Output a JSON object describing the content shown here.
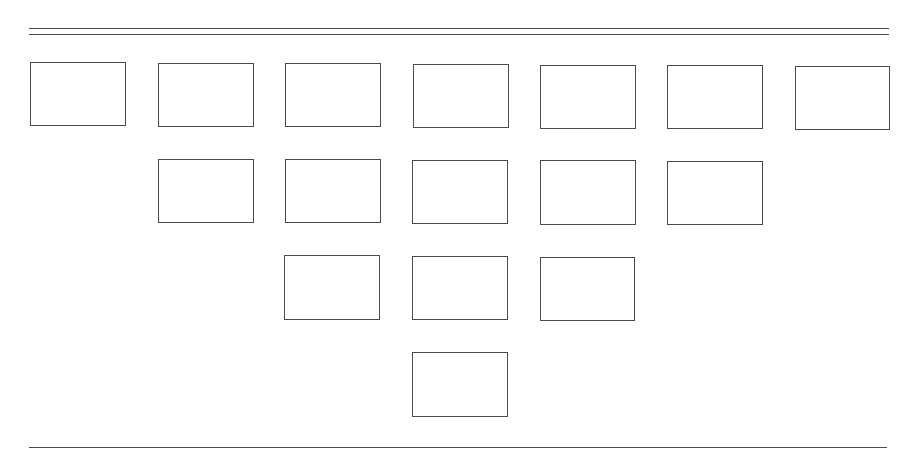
{
  "diagram": {
    "type": "inverted-pyramid-of-boxes",
    "colors": {
      "stroke": "#4a4a4a",
      "background": "#ffffff"
    },
    "rules": [
      {
        "id": "top-rule-1",
        "x1": 29,
        "y": 28,
        "x2": 889
      },
      {
        "id": "top-rule-2",
        "x1": 29,
        "y": 34,
        "x2": 889
      },
      {
        "id": "bottom-rule",
        "x1": 29,
        "y": 447,
        "x2": 887
      }
    ],
    "rows": [
      {
        "row": 1,
        "count": 7,
        "boxes": [
          {
            "x": 30,
            "y": 62,
            "w": 96,
            "h": 64
          },
          {
            "x": 158,
            "y": 63,
            "w": 96,
            "h": 64
          },
          {
            "x": 285,
            "y": 63,
            "w": 96,
            "h": 64
          },
          {
            "x": 413,
            "y": 64,
            "w": 96,
            "h": 64
          },
          {
            "x": 540,
            "y": 65,
            "w": 96,
            "h": 64
          },
          {
            "x": 667,
            "y": 65,
            "w": 96,
            "h": 64
          },
          {
            "x": 795,
            "y": 66,
            "w": 95,
            "h": 64
          }
        ]
      },
      {
        "row": 2,
        "count": 5,
        "boxes": [
          {
            "x": 158,
            "y": 159,
            "w": 96,
            "h": 64
          },
          {
            "x": 285,
            "y": 159,
            "w": 96,
            "h": 64
          },
          {
            "x": 412,
            "y": 160,
            "w": 96,
            "h": 64
          },
          {
            "x": 540,
            "y": 160,
            "w": 96,
            "h": 65
          },
          {
            "x": 667,
            "y": 161,
            "w": 96,
            "h": 64
          }
        ]
      },
      {
        "row": 3,
        "count": 3,
        "boxes": [
          {
            "x": 284,
            "y": 255,
            "w": 96,
            "h": 65
          },
          {
            "x": 412,
            "y": 256,
            "w": 96,
            "h": 64
          },
          {
            "x": 540,
            "y": 257,
            "w": 95,
            "h": 64
          }
        ]
      },
      {
        "row": 4,
        "count": 1,
        "boxes": [
          {
            "x": 412,
            "y": 352,
            "w": 96,
            "h": 65
          }
        ]
      }
    ]
  }
}
